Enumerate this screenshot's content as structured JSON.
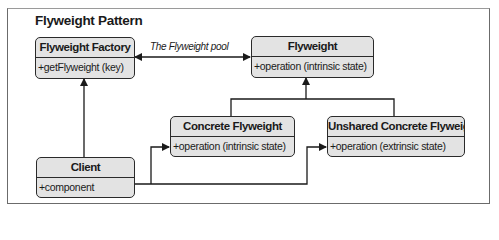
{
  "diagram": {
    "title": "Flyweight Pattern",
    "pool_label": "The Flyweight pool",
    "classes": {
      "factory": {
        "name": "Flyweight Factory",
        "members": [
          "+getFlyweight (key)"
        ]
      },
      "flyweight": {
        "name": "Flyweight",
        "members": [
          "+operation (intrinsic state)"
        ]
      },
      "concrete": {
        "name": "Concrete Flyweight",
        "members": [
          "+operation (intrinsic state)"
        ]
      },
      "unshared": {
        "name": "Unshared Concrete Flyweight",
        "members": [
          "+operation (extrinsic state)"
        ]
      },
      "client": {
        "name": "Client",
        "members": [
          "+component"
        ]
      }
    },
    "relations": [
      {
        "from": "Flyweight Factory",
        "to": "Flyweight",
        "type": "bidirectional-association",
        "label": "The Flyweight pool"
      },
      {
        "from": "Client",
        "to": "Flyweight Factory",
        "type": "association"
      },
      {
        "from": "Concrete Flyweight",
        "to": "Flyweight",
        "type": "inheritance"
      },
      {
        "from": "Unshared Concrete Flyweight",
        "to": "Flyweight",
        "type": "inheritance"
      },
      {
        "from": "Client",
        "to": "Concrete Flyweight",
        "type": "association"
      },
      {
        "from": "Client",
        "to": "Unshared Concrete Flyweight",
        "type": "association"
      }
    ],
    "colors": {
      "box_fill": "#e3e3e3",
      "stroke": "#2a2a2a",
      "background": "#ffffff"
    }
  }
}
